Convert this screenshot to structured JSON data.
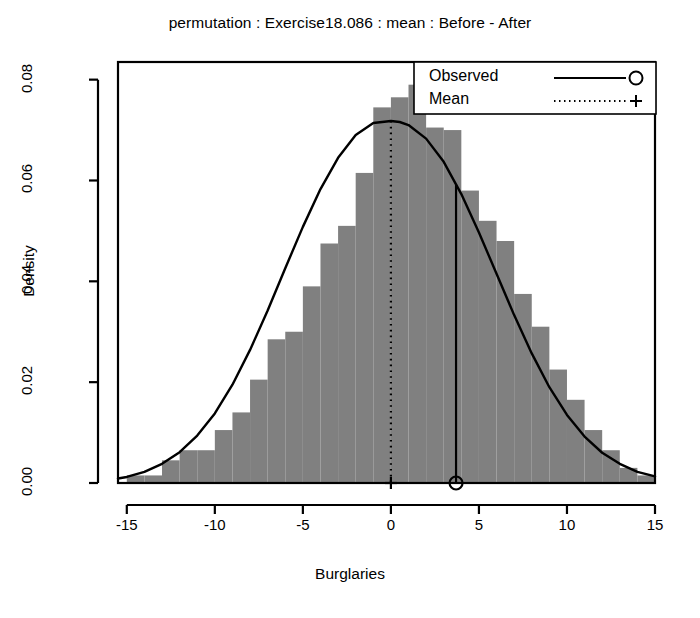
{
  "chart_data": {
    "type": "bar",
    "title": "permutation : Exercise18.086 : mean : Before - After",
    "xlabel": "Burglaries",
    "ylabel": "Density",
    "xlim": [
      -15.5,
      15.0
    ],
    "ylim": [
      0.0,
      0.0835
    ],
    "grid": false,
    "legend_position": "top-right",
    "xticks": [
      -15,
      -10,
      -5,
      0,
      5,
      10,
      15
    ],
    "xtick_labels": [
      "-15",
      "-10",
      "-5",
      "0",
      "5",
      "10",
      "15"
    ],
    "yticks": [
      0.0,
      0.02,
      0.04,
      0.06,
      0.08
    ],
    "ytick_labels": [
      "0.00",
      "0.02",
      "0.04",
      "0.06",
      "0.08"
    ],
    "bar_color": "#808080",
    "line_color": "#000000",
    "bin_width": 1,
    "bin_left_edges": [
      -15,
      -14,
      -13,
      -12,
      -11,
      -10,
      -9,
      -8,
      -7,
      -6,
      -5,
      -4,
      -3,
      -2,
      -1,
      0,
      1,
      2,
      3,
      4,
      5,
      6,
      7,
      8,
      9,
      10,
      11,
      12,
      13,
      14
    ],
    "categories": [
      "-15",
      "-14",
      "-13",
      "-12",
      "-11",
      "-10",
      "-9",
      "-8",
      "-7",
      "-6",
      "-5",
      "-4",
      "-3",
      "-2",
      "-1",
      "0",
      "1",
      "2",
      "3",
      "4",
      "5",
      "6",
      "7",
      "8",
      "9",
      "10",
      "11",
      "12",
      "13",
      "14"
    ],
    "values": [
      0.0015,
      0.0015,
      0.0045,
      0.0065,
      0.0065,
      0.0105,
      0.014,
      0.0205,
      0.0285,
      0.03,
      0.039,
      0.0475,
      0.051,
      0.0615,
      0.0745,
      0.0765,
      0.079,
      0.0705,
      0.07,
      0.058,
      0.052,
      0.048,
      0.0375,
      0.031,
      0.0225,
      0.0165,
      0.0105,
      0.0065,
      0.003,
      0.0015
    ],
    "series": [
      {
        "name": "Density curve",
        "type": "line",
        "style": "solid",
        "x": [
          -15.5,
          -15,
          -14,
          -13,
          -12,
          -11,
          -10,
          -9,
          -8,
          -7,
          -6,
          -5,
          -4,
          -3,
          -2,
          -1,
          0,
          0.5,
          1,
          2,
          3,
          4,
          5,
          6,
          7,
          8,
          9,
          10,
          11,
          12,
          13,
          14,
          15
        ],
        "y": [
          0.0009,
          0.0012,
          0.0022,
          0.0038,
          0.0061,
          0.0094,
          0.0138,
          0.0195,
          0.0264,
          0.0342,
          0.0426,
          0.0508,
          0.0583,
          0.0645,
          0.069,
          0.0714,
          0.0718,
          0.0716,
          0.071,
          0.0683,
          0.0637,
          0.0573,
          0.0497,
          0.0415,
          0.0333,
          0.0257,
          0.019,
          0.0135,
          0.0092,
          0.006,
          0.0038,
          0.0022,
          0.0013
        ]
      }
    ],
    "annotations": [
      {
        "name": "observed",
        "type": "vline",
        "x": 3.7,
        "style": "solid",
        "marker": "circle",
        "marker_y": 0.0
      },
      {
        "name": "mean",
        "type": "vline",
        "x": 0.0,
        "style": "dotted",
        "marker": "plus",
        "marker_y": 0.0
      }
    ],
    "legend": [
      {
        "label": "Observed",
        "style": "solid",
        "marker": "circle"
      },
      {
        "label": "Mean",
        "style": "dotted",
        "marker": "plus"
      }
    ]
  }
}
